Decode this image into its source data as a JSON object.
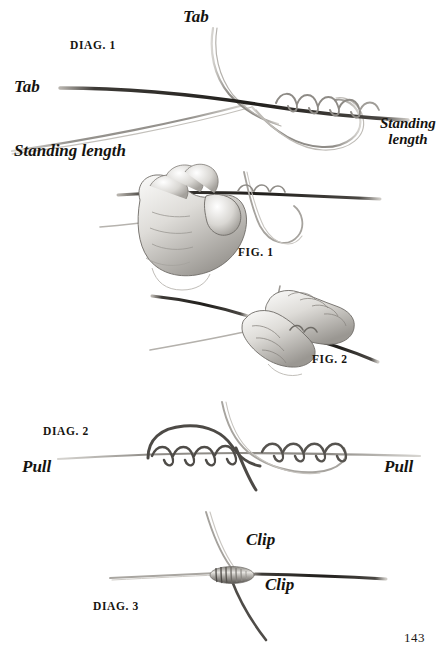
{
  "page": {
    "width": 447,
    "height": 669,
    "background": "#ffffff",
    "ink_color": "#15130f",
    "folio": "143"
  },
  "diagram1": {
    "caption": "DIAG. 1",
    "labels": {
      "tab_top": "Tab",
      "tab_left": "Tab",
      "standing_left": "Standing length",
      "standing_right_line1": "Standing",
      "standing_right_line2": "length"
    }
  },
  "figure1": {
    "caption": "FIG. 1"
  },
  "figure2": {
    "caption": "FIG. 2"
  },
  "diagram2": {
    "caption": "DIAG. 2",
    "labels": {
      "pull_left": "Pull",
      "pull_right": "Pull"
    }
  },
  "diagram3": {
    "caption": "DIAG. 3",
    "labels": {
      "clip_top": "Clip",
      "clip_bottom": "Clip"
    }
  }
}
